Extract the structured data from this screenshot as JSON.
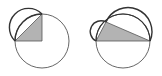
{
  "figures": [
    {
      "id": "left",
      "description": "Quarter-circle right triangle with semicircle on hypotenuse inside circle",
      "circle": {
        "cx": 42,
        "cy": 41,
        "r": 27
      },
      "triangle": [
        [
          15,
          41
        ],
        [
          42,
          41
        ],
        [
          42,
          14
        ]
      ],
      "semicircles": [
        {
          "from": [
            15,
            41
          ],
          "to": [
            42,
            14
          ],
          "r": 19.1
        }
      ]
    },
    {
      "id": "right",
      "description": "Right triangle inscribed on diameter with semicircles on both legs",
      "circle": {
        "cx": 123,
        "cy": 41,
        "r": 27
      },
      "triangle": [
        [
          96,
          41
        ],
        [
          150,
          41
        ],
        [
          106,
          22
        ]
      ],
      "semicircles": [
        {
          "from": [
            96,
            41
          ],
          "to": [
            106,
            22
          ],
          "r": 10.7
        },
        {
          "from": [
            106,
            22
          ],
          "to": [
            150,
            41
          ],
          "r": 24.0
        }
      ]
    }
  ],
  "colors": {
    "stroke": "#333333",
    "thin_stroke": "#555555",
    "fill": "#b3b3b3",
    "background": "#ffffff"
  }
}
